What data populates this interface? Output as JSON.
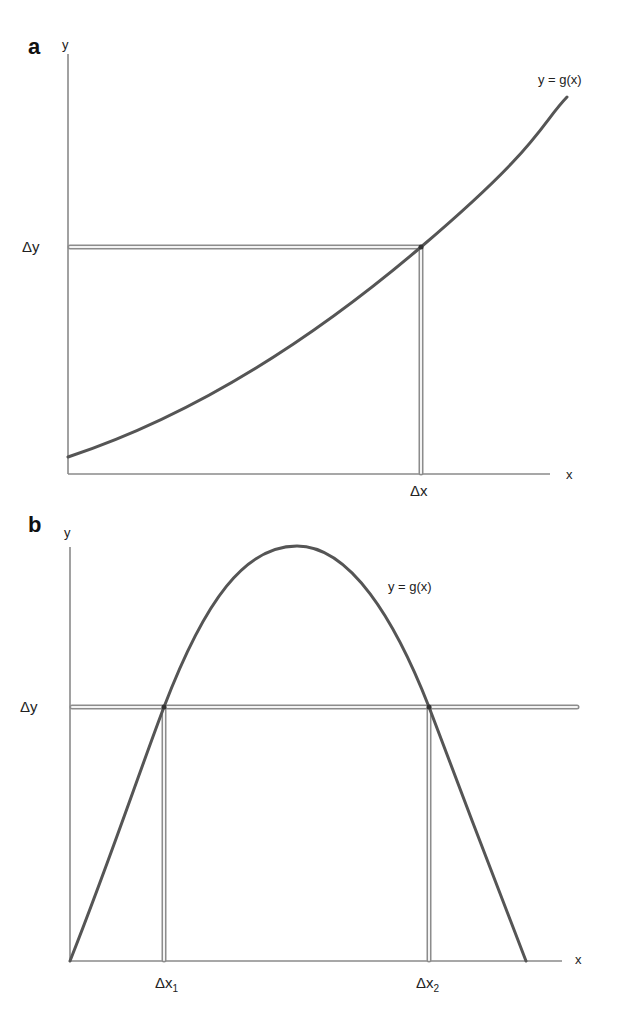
{
  "panel_a": {
    "label": "a",
    "y_axis_label": "y",
    "x_axis_label": "x",
    "curve_label": "y = g(x)",
    "delta_y_label": "Δy",
    "delta_x_label": "Δx"
  },
  "panel_b": {
    "label": "b",
    "y_axis_label": "y",
    "x_axis_label": "x",
    "curve_label": "y = g(x)",
    "delta_y_label": "Δy",
    "delta_x1_label": "Δx",
    "delta_x1_sub": "1",
    "delta_x2_label": "Δx",
    "delta_x2_sub": "2"
  },
  "colors": {
    "curve": "#555555",
    "axis": "#8a8a8a",
    "guide_line": "#8c8c8c",
    "background": "#ffffff"
  }
}
